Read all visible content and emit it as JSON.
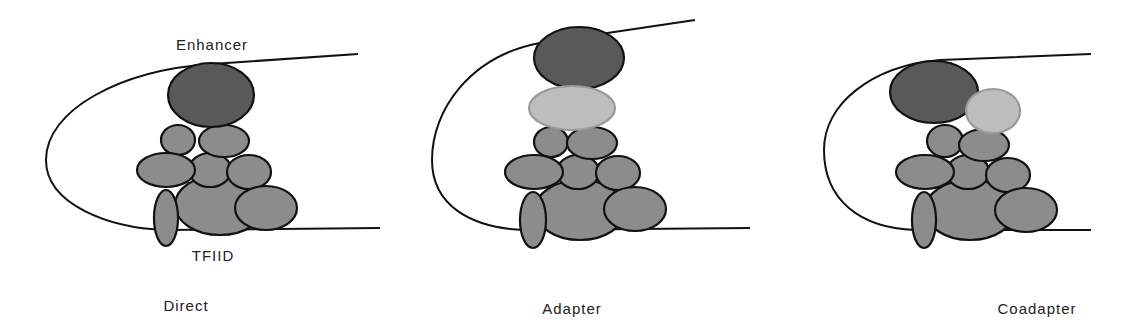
{
  "diagram": {
    "colors": {
      "enhancer_fill": "#595959",
      "tfiid_fill": "#8c8c8c",
      "adapter_fill": "#bdbdbd",
      "adapter_stroke": "#9a9a9a",
      "line": "#111111",
      "text": "#222222"
    },
    "labels": {
      "enhancer": "Enhancer",
      "tfiid": "TFIID"
    },
    "panels": [
      {
        "id": "direct",
        "caption": "Direct",
        "has_adapter": false,
        "has_coadapter": false
      },
      {
        "id": "adapter",
        "caption": "Adapter",
        "has_adapter": true,
        "has_coadapter": false
      },
      {
        "id": "coadapter",
        "caption": "Coadapter",
        "has_adapter": false,
        "has_coadapter": true
      }
    ]
  }
}
